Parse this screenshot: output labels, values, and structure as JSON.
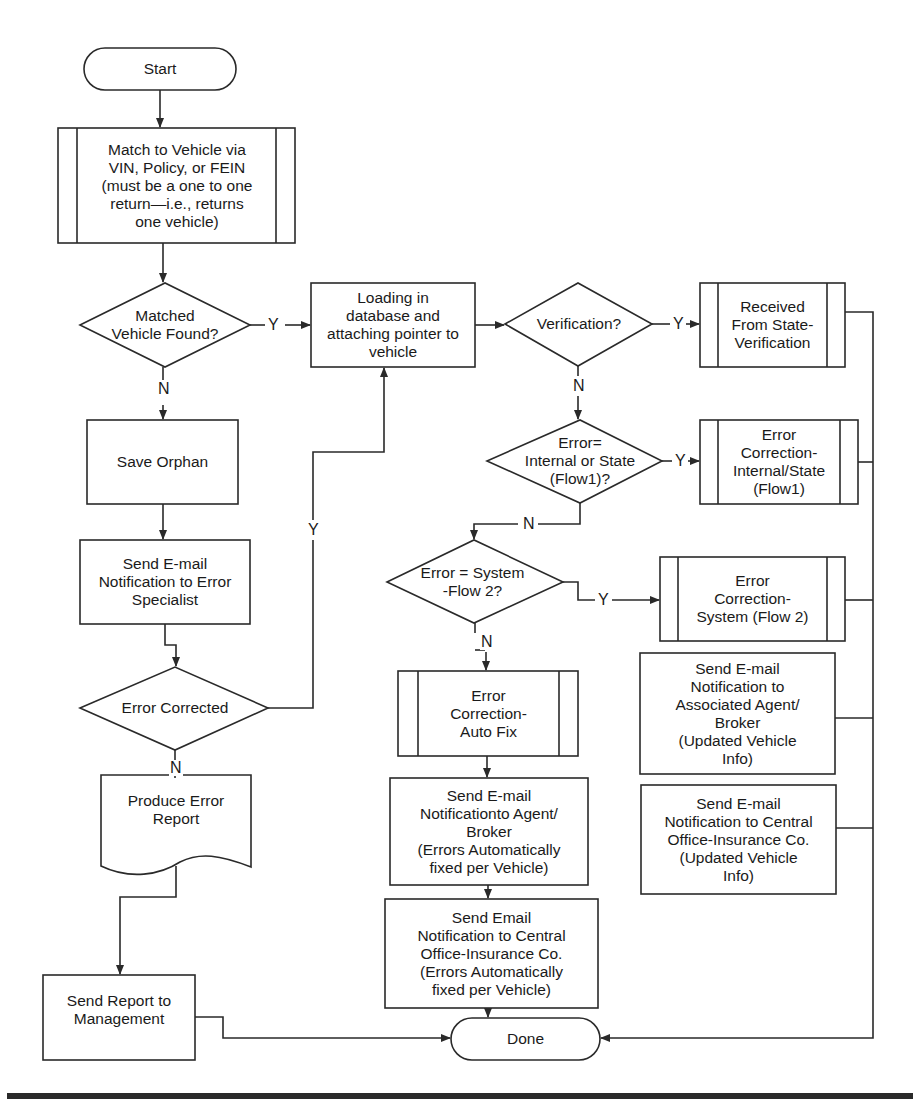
{
  "diagram": {
    "type": "flowchart",
    "nodes": {
      "start": "Start",
      "match": "Match to Vehicle via\nVIN, Policy, or FEIN\n(must be a one to one\nreturn—i.e., returns\none vehicle)",
      "matched_found": "Matched\nVehicle Found?",
      "loading": "Loading in\ndatabase and\nattaching pointer to\nvehicle",
      "verification": "Verification?",
      "received_state": "Received\nFrom State-\nVerification",
      "error_internal_q": "Error=\nInternal or State\n(Flow1)?",
      "error_corr_internal": "Error\nCorrection-\nInternal/State\n(Flow1)",
      "error_system_q": "Error = System\n-Flow 2?",
      "error_corr_system": "Error\nCorrection-\nSystem (Flow 2)",
      "email_assoc_agent": "Send E-mail\nNotification to\nAssociated Agent/\nBroker\n(Updated Vehicle\nInfo)",
      "email_central_updated": "Send E-mail\nNotification to Central\nOffice-Insurance Co.\n(Updated Vehicle\nInfo)",
      "error_corr_auto": "Error\nCorrection-\nAuto Fix",
      "email_agent_auto": "Send E-mail\nNotificationto Agent/\nBroker\n(Errors Automatically\nfixed per Vehicle)",
      "email_central_auto": "Send Email\nNotification to Central\nOffice-Insurance Co.\n(Errors Automatically\nfixed per Vehicle)",
      "done": "Done",
      "save_orphan": "Save Orphan",
      "email_specialist": "Send E-mail\nNotification to Error\nSpecialist",
      "error_corrected": "Error Corrected",
      "produce_report": "Produce Error\nReport",
      "send_report": "Send Report to\nManagement"
    },
    "edge_labels": {
      "matched_yes": "Y",
      "matched_no": "N",
      "verification_yes": "Y",
      "verification_no": "N",
      "internal_yes": "Y",
      "internal_no": "N",
      "system_yes": "Y",
      "system_no": "N",
      "corrected_yes": "Y",
      "corrected_no": "N"
    },
    "colors": {
      "stroke": "#2a2a2a",
      "background": "#ffffff"
    }
  }
}
